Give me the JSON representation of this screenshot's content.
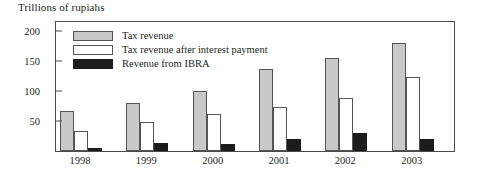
{
  "chart_data": {
    "type": "bar",
    "title": "Trillions of rupiahs",
    "xlabel": "",
    "ylabel": "",
    "ylim": [
      0,
      215
    ],
    "yticks": [
      50,
      100,
      150,
      200
    ],
    "grid": false,
    "legend_position": "top-left-inside",
    "categories": [
      "1998",
      "1999",
      "2000",
      "2001",
      "2002",
      "2003"
    ],
    "series": [
      {
        "name": "Tax revenue",
        "color": "#c9c9c9",
        "values": [
          66,
          80,
          100,
          137,
          155,
          180
        ]
      },
      {
        "name": "Tax revenue after interest payment",
        "color": "#ffffff",
        "values": [
          33,
          48,
          62,
          73,
          88,
          123
        ]
      },
      {
        "name": "Revenue from IBRA",
        "color": "#1c1c1c",
        "values": [
          5,
          13,
          12,
          20,
          30,
          20
        ]
      }
    ]
  },
  "axis": {
    "y_tick_labels": [
      "200",
      "150",
      "100",
      "50"
    ],
    "x_tick_labels": [
      "1998",
      "1999",
      "2000",
      "2001",
      "2002",
      "2003"
    ]
  },
  "legend": {
    "items": [
      {
        "label": "Tax revenue",
        "swatch": "tax-revenue"
      },
      {
        "label": "Tax revenue after interest payment",
        "swatch": "tax-after-interest"
      },
      {
        "label": "Revenue from IBRA",
        "swatch": "ibra"
      }
    ]
  },
  "colors": {
    "tax_revenue": "#c9c9c9",
    "tax_after_interest": "#ffffff",
    "ibra": "#1c1c1c",
    "axis": "#4a4a4a",
    "text": "#231f20"
  }
}
